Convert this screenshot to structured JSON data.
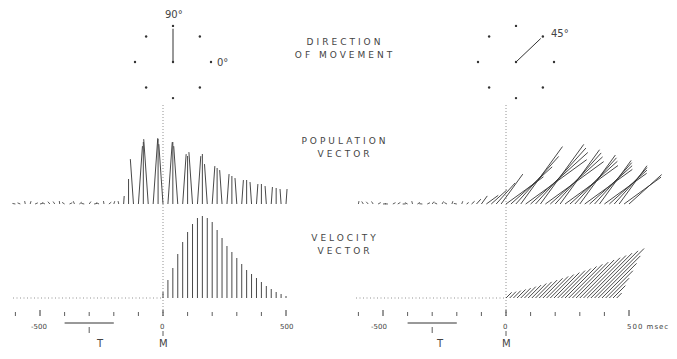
{
  "labels": {
    "direction": [
      "DIRECTION",
      "OF MOVEMENT"
    ],
    "population": [
      "POPULATION",
      "VECTOR"
    ],
    "velocity": [
      "VELOCITY",
      "VECTOR"
    ]
  },
  "panels": [
    {
      "id": "left",
      "direction_deg": 90,
      "direction_label": "90°",
      "zero_label": "0°"
    },
    {
      "id": "right",
      "direction_deg": 45,
      "direction_label": "45°"
    }
  ],
  "axis": {
    "tick_labels": {
      "neg": "-500",
      "zero": "0",
      "pos": "500"
    },
    "unit": "msec",
    "pos_right": "500 msec",
    "T": "T",
    "M": "M"
  },
  "chart_data": {
    "type": "vector-time-series",
    "xlabel": "time (msec) relative to movement onset M",
    "xlim": [
      -600,
      500
    ],
    "x_ticks": [
      -500,
      0,
      500
    ],
    "markers": {
      "T": "target onset (approx -300 msec, range bar -400 to -200)",
      "M": "movement onset (0 msec)"
    },
    "series": [
      {
        "panel": "left",
        "direction_deg": 90,
        "name": "Population vector",
        "note": "vectors near zero before ~-160 msec, rise sharply, peak near 0 msec, decay by 500 msec",
        "x": [
          -160,
          -140,
          -120,
          -100,
          -80,
          -60,
          -40,
          -20,
          0,
          20,
          40,
          60,
          80,
          100,
          120,
          140,
          160,
          180,
          200,
          220,
          240,
          260,
          280,
          300,
          320,
          340,
          360,
          380,
          400,
          420,
          440,
          460,
          480,
          500
        ],
        "length": [
          8,
          25,
          45,
          58,
          62,
          65,
          66,
          65,
          60,
          62,
          62,
          58,
          50,
          48,
          52,
          48,
          50,
          40,
          38,
          36,
          34,
          30,
          28,
          26,
          24,
          24,
          22,
          20,
          20,
          18,
          17,
          16,
          15,
          15
        ]
      },
      {
        "panel": "left",
        "direction_deg": 90,
        "name": "Velocity vector",
        "note": "bell-shaped, peak near 180 msec",
        "x": [
          0,
          20,
          40,
          60,
          80,
          100,
          120,
          140,
          160,
          180,
          200,
          220,
          240,
          260,
          280,
          300,
          320,
          340,
          360,
          380,
          400,
          420,
          440,
          460,
          480,
          500
        ],
        "length": [
          6,
          18,
          30,
          44,
          56,
          66,
          74,
          80,
          82,
          80,
          76,
          68,
          60,
          52,
          46,
          40,
          34,
          28,
          24,
          20,
          16,
          12,
          9,
          6,
          4,
          2
        ]
      },
      {
        "panel": "right",
        "direction_deg": 45,
        "name": "Population vector",
        "note": "rises from ~-150 msec, peaks ~100 msec",
        "length_peak": 70
      },
      {
        "panel": "right",
        "direction_deg": 45,
        "name": "Velocity vector",
        "note": "peaks near 350 msec",
        "length_peak": 70
      }
    ]
  }
}
